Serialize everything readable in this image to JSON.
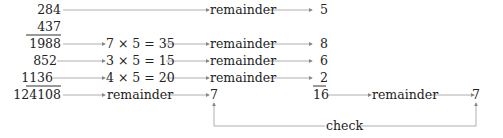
{
  "numbers": {
    "n1": "284",
    "n2": "437",
    "n3": "1988",
    "n4": "852",
    "n5": "1136",
    "n6": "124108"
  },
  "products": {
    "p1": "7 × 5 = 35",
    "p2": "3 × 5 = 15",
    "p3": "4 × 5 = 20"
  },
  "labels": {
    "remainder": "remainder",
    "check": "check"
  },
  "remainders": {
    "r1": "5",
    "r2": "8",
    "r3": "6",
    "r4": "2",
    "sum": "16",
    "result_left": "7",
    "result_right": "7"
  }
}
